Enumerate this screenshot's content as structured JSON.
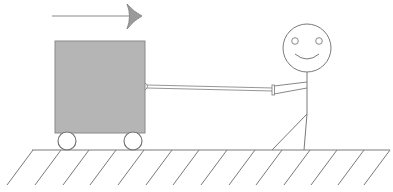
{
  "diagram": {
    "title": "",
    "elements": {
      "direction_arrow": {
        "x1": 52,
        "y1": 16,
        "x2": 136,
        "y2": 16,
        "head_tip_x": 142,
        "direction": "right"
      },
      "box": {
        "x": 55,
        "y": 41,
        "width": 90,
        "height": 92,
        "fill": "#b4b4b4",
        "stroke": "#8c8c8c"
      },
      "wheels": [
        {
          "cx": 67,
          "cy": 141,
          "r": 9
        },
        {
          "cx": 133,
          "cy": 141,
          "r": 9
        }
      ],
      "rope": {
        "x1": 146,
        "y1": 86,
        "x2": 272,
        "y2": 90
      },
      "person": {
        "head": {
          "cx": 307,
          "cy": 48,
          "r": 24
        },
        "eyes": [
          {
            "cx": 295,
            "cy": 41,
            "r": 3.5
          },
          {
            "cx": 319,
            "cy": 41,
            "r": 3.5
          }
        ],
        "body": {
          "x": 307,
          "y1": 72,
          "y2": 114
        },
        "arm": {
          "shoulder_x": 307,
          "shoulder_y": 84,
          "hand_x": 273,
          "hand_y": 89
        },
        "legs": [
          {
            "x2": 272,
            "y2": 150
          },
          {
            "x2": 304,
            "y2": 150
          }
        ]
      },
      "ground": {
        "x1": 32,
        "x2": 390,
        "y": 150,
        "hatch_spacing": 27.6,
        "hatch_count": 14,
        "hatch_depth": 35,
        "hatch_slant": 26
      }
    },
    "colors": {
      "line": "#7a7a7a",
      "box_fill": "#b4b4b4",
      "background": "#ffffff"
    }
  }
}
